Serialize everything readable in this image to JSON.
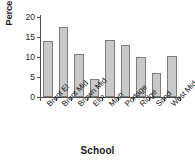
{
  "chart_data": {
    "type": "bar",
    "title": "",
    "xlabel": "School",
    "ylabel": "Percent",
    "categories": [
      "Brent El",
      "Brent Mid",
      "Brown Mid",
      "Elm",
      "Main",
      "Portage",
      "Ridge",
      "Sand",
      "West Mid"
    ],
    "values": [
      14.0,
      17.5,
      10.8,
      4.5,
      14.2,
      12.9,
      10.0,
      5.9,
      10.2
    ],
    "ylim": [
      0,
      20
    ],
    "yticks": [
      0,
      5,
      10,
      15,
      20
    ],
    "ytick_labels": [
      "0",
      "5",
      "10",
      "15",
      "20"
    ],
    "grid": false,
    "legend": false,
    "bar_fill_color": "#c9c9c9",
    "bar_edge_color": "#7d7d7d",
    "axis_color": "#4a4a4a",
    "background_color": "#ffffff"
  }
}
